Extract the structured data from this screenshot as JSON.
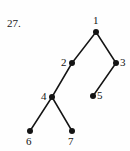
{
  "figure": {
    "problem_number": "27.",
    "kind": "rooted-tree-diagram",
    "ink_color": "#141414",
    "background_color": "#fefefe",
    "width": 130,
    "height": 151
  },
  "nodes": [
    {
      "id": "1",
      "label": "1",
      "x": 96,
      "y": 32,
      "label_x": 93,
      "label_y": 15,
      "label_anchor": "above"
    },
    {
      "id": "2",
      "label": "2",
      "x": 72,
      "y": 63,
      "label_x": 61,
      "label_y": 57,
      "label_anchor": "left"
    },
    {
      "id": "3",
      "label": "3",
      "x": 116,
      "y": 63,
      "label_x": 120,
      "label_y": 57,
      "label_anchor": "right"
    },
    {
      "id": "4",
      "label": "4",
      "x": 52,
      "y": 97,
      "label_x": 41,
      "label_y": 91,
      "label_anchor": "left"
    },
    {
      "id": "5",
      "label": "5",
      "x": 93,
      "y": 96,
      "label_x": 97,
      "label_y": 90,
      "label_anchor": "right"
    },
    {
      "id": "6",
      "label": "6",
      "x": 30,
      "y": 131,
      "label_x": 26,
      "label_y": 136,
      "label_anchor": "below"
    },
    {
      "id": "7",
      "label": "7",
      "x": 72,
      "y": 131,
      "label_x": 68,
      "label_y": 136,
      "label_anchor": "below"
    }
  ],
  "edges": [
    {
      "from": "1",
      "to": "2"
    },
    {
      "from": "1",
      "to": "3"
    },
    {
      "from": "2",
      "to": "4"
    },
    {
      "from": "3",
      "to": "5"
    },
    {
      "from": "4",
      "to": "6"
    },
    {
      "from": "4",
      "to": "7"
    }
  ]
}
